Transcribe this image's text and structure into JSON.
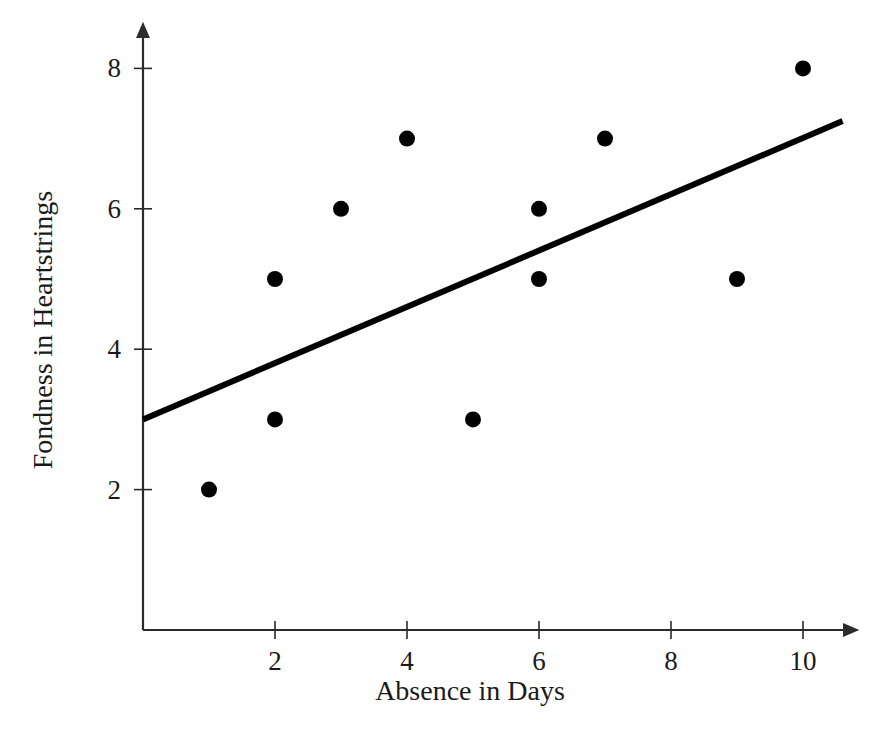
{
  "chart_data": {
    "type": "scatter",
    "title": "",
    "xlabel": "Absence in Days",
    "ylabel": "Fondness in Heartstrings",
    "xlim": [
      0,
      10.9
    ],
    "ylim": [
      0,
      8.7
    ],
    "xticks": [
      "2",
      "4",
      "6",
      "8",
      "10"
    ],
    "xtick_values": [
      2,
      4,
      6,
      8,
      10
    ],
    "yticks": [
      "2",
      "4",
      "6",
      "8"
    ],
    "ytick_values": [
      2,
      4,
      6,
      8
    ],
    "grid": false,
    "legend": null,
    "x": [
      1,
      2,
      2,
      3,
      4,
      5,
      6,
      6,
      7,
      9,
      10
    ],
    "y": [
      2,
      5,
      3,
      6,
      7,
      3,
      6,
      5,
      7,
      5,
      8
    ],
    "points": [
      {
        "x": 1,
        "y": 2
      },
      {
        "x": 2,
        "y": 5
      },
      {
        "x": 2,
        "y": 3
      },
      {
        "x": 3,
        "y": 6
      },
      {
        "x": 4,
        "y": 7
      },
      {
        "x": 5,
        "y": 3
      },
      {
        "x": 6,
        "y": 6
      },
      {
        "x": 6,
        "y": 5
      },
      {
        "x": 7,
        "y": 7
      },
      {
        "x": 9,
        "y": 5
      },
      {
        "x": 10,
        "y": 8
      }
    ],
    "marker_color": "#000000",
    "marker_size": 9,
    "trendline": {
      "type": "line",
      "x": [
        0,
        10.6
      ],
      "y": [
        3.0,
        7.25
      ],
      "slope": 0.401,
      "intercept": 3.0,
      "color": "#000000",
      "width": 6
    },
    "axis_color": "#2b2b2b",
    "background": "#ffffff"
  }
}
